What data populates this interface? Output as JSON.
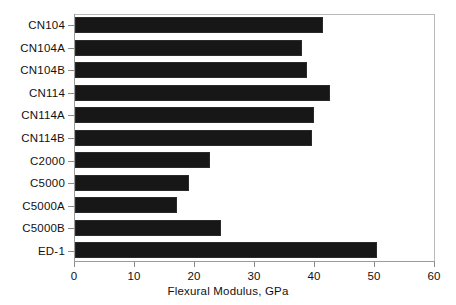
{
  "chart": {
    "type": "bar",
    "orientation": "horizontal",
    "axis_title": "Flexural Modulus, GPa"
  },
  "chart_data": {
    "type": "bar",
    "orientation": "horizontal",
    "title": "",
    "xlabel": "Flexural Modulus, GPa",
    "ylabel": "",
    "xlim": [
      0,
      60
    ],
    "xticks": [
      0,
      10,
      20,
      30,
      40,
      50,
      60
    ],
    "xtick_labels": [
      "0",
      "10",
      "20",
      "30",
      "40",
      "50",
      "60"
    ],
    "grid": false,
    "legend": false,
    "bar_color": "#171717",
    "categories": [
      "CN104",
      "CN104A",
      "CN104B",
      "CN114",
      "CN114A",
      "CN114B",
      "C2000",
      "C5000",
      "C5000A",
      "C5000B",
      "ED-1"
    ],
    "values": [
      41.3,
      37.9,
      38.7,
      42.5,
      39.8,
      39.5,
      22.5,
      19.0,
      17.0,
      24.3,
      50.4
    ]
  }
}
